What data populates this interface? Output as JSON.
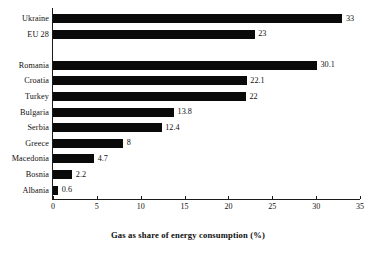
{
  "chart_data": {
    "type": "bar",
    "orientation": "horizontal",
    "title": "",
    "xlabel": "Gas as share of energy consumption (%)",
    "ylabel": "",
    "categories": [
      "Ukraine",
      "EU 28",
      "Romania",
      "Croatia",
      "Turkey",
      "Bulgaria",
      "Serbia",
      "Greece",
      "Macedonia",
      "Bosnia",
      "Albania"
    ],
    "values": [
      33,
      23,
      30.1,
      22.1,
      22,
      13.8,
      12.4,
      8,
      4.7,
      2.2,
      0.6
    ],
    "value_labels": [
      "33",
      "23",
      "30.1",
      "22.1",
      "22",
      "13.8",
      "12.4",
      "8",
      "4.7",
      "2.2",
      "0.6"
    ],
    "xlim": [
      0,
      35
    ],
    "xticks": [
      0,
      5,
      10,
      15,
      20,
      25,
      30,
      35
    ],
    "xtick_labels": [
      "0",
      "5",
      "10",
      "15",
      "20",
      "25",
      "30",
      "35"
    ],
    "grid": false,
    "legend": null,
    "bar_color": "#0a0a0a",
    "background_color": "#ffffff",
    "axis_color": "#1a1a1a",
    "group_gap_after_index": 1
  }
}
